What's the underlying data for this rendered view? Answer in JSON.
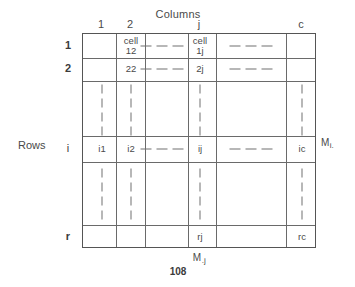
{
  "figure": {
    "columns_axis_label": "Columns",
    "rows_axis_label": "Rows",
    "page_number": "108",
    "row_margin_label": {
      "base": "M",
      "sub": "i."
    },
    "column_margin_label": {
      "base": "M",
      "sub": ".j"
    }
  },
  "column_headers": [
    {
      "label": "1",
      "x": 101
    },
    {
      "label": "2",
      "x": 130
    },
    {
      "label": "j",
      "x": 199
    },
    {
      "label": "c",
      "x": 301
    }
  ],
  "row_headers": [
    {
      "label": "1",
      "y": 45,
      "bold": true
    },
    {
      "label": "2",
      "y": 68,
      "bold": true
    },
    {
      "label": "i",
      "y": 148,
      "bold": false
    },
    {
      "label": "r",
      "y": 236,
      "bold": true
    }
  ],
  "cells": [
    {
      "text": "cell\n12",
      "x": 130,
      "y": 45,
      "name": "cell-1-2"
    },
    {
      "text": "cell\n1j",
      "x": 199,
      "y": 45,
      "name": "cell-1-j"
    },
    {
      "text": "22",
      "x": 130,
      "y": 68,
      "name": "cell-2-2"
    },
    {
      "text": "2j",
      "x": 199,
      "y": 68,
      "name": "cell-2-j"
    },
    {
      "text": "i1",
      "x": 101,
      "y": 148,
      "name": "cell-i-1"
    },
    {
      "text": "i2",
      "x": 130,
      "y": 148,
      "name": "cell-i-2"
    },
    {
      "text": "ij",
      "x": 199,
      "y": 148,
      "name": "cell-i-j"
    },
    {
      "text": "ic",
      "x": 301,
      "y": 148,
      "name": "cell-i-c"
    },
    {
      "text": "rj",
      "x": 199,
      "y": 236,
      "name": "cell-r-j"
    },
    {
      "text": "rc",
      "x": 301,
      "y": 236,
      "name": "cell-r-c"
    }
  ],
  "horizontal_ellipses": [
    {
      "x": 161,
      "y": 45,
      "name": "row-1-ellipsis-left"
    },
    {
      "x": 250,
      "y": 45,
      "name": "row-1-ellipsis-right"
    },
    {
      "x": 161,
      "y": 68,
      "name": "row-2-ellipsis-left"
    },
    {
      "x": 250,
      "y": 68,
      "name": "row-2-ellipsis-right"
    },
    {
      "x": 161,
      "y": 148,
      "name": "row-i-ellipsis-left"
    },
    {
      "x": 250,
      "y": 148,
      "name": "row-i-ellipsis-right"
    }
  ],
  "vertical_ellipses": [
    {
      "x": 101,
      "y": 109,
      "name": "col-1-ellipsis-upper"
    },
    {
      "x": 130,
      "y": 109,
      "name": "col-2-ellipsis-upper"
    },
    {
      "x": 199,
      "y": 109,
      "name": "col-j-ellipsis-upper"
    },
    {
      "x": 301,
      "y": 109,
      "name": "col-c-ellipsis-upper"
    },
    {
      "x": 101,
      "y": 193,
      "name": "col-1-ellipsis-lower"
    },
    {
      "x": 130,
      "y": 193,
      "name": "col-2-ellipsis-lower"
    },
    {
      "x": 199,
      "y": 193,
      "name": "col-j-ellipsis-lower"
    },
    {
      "x": 301,
      "y": 193,
      "name": "col-c-ellipsis-lower"
    }
  ],
  "grid": {
    "left": 82,
    "top": 33,
    "width": 234,
    "height": 215,
    "vertical_lines_x": [
      33,
      62,
      105,
      133,
      203
    ],
    "horizontal_lines_y": [
      24,
      47,
      102,
      128,
      191
    ]
  },
  "colors": {
    "background": "#ffffff",
    "rule": "#6a6a6a",
    "text": "#4a4a4a"
  }
}
